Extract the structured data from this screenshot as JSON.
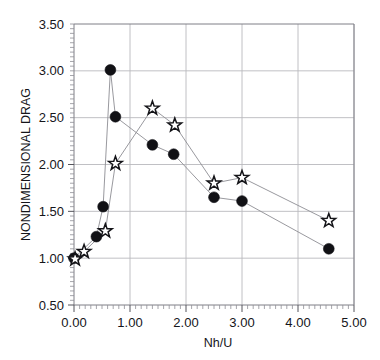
{
  "chart_data": {
    "type": "line",
    "title": "",
    "xlabel": "Nh/U",
    "ylabel": "NONDIMENSIONAL DRAG",
    "xlim": [
      0.0,
      5.0
    ],
    "ylim": [
      0.5,
      3.5
    ],
    "xticks": [
      0.0,
      1.0,
      2.0,
      3.0,
      4.0,
      5.0
    ],
    "xtick_labels": [
      "0.00",
      "1.00",
      "2.00",
      "3.00",
      "4.00",
      "5.00"
    ],
    "yticks": [
      0.5,
      1.0,
      1.5,
      2.0,
      2.5,
      3.0,
      3.5
    ],
    "ytick_labels": [
      "0.50",
      "1.00",
      "1.50",
      "2.00",
      "2.50",
      "3.00",
      "3.50"
    ],
    "grid": true,
    "legend": "none",
    "x_minor_tick_step": 0.1,
    "y_minor_tick_step": 0.05,
    "series": [
      {
        "name": "circle-series",
        "marker": "circle",
        "color": "#111115",
        "points": [
          {
            "x": 0.0,
            "y": 1.0
          },
          {
            "x": 0.4,
            "y": 1.23
          },
          {
            "x": 0.52,
            "y": 1.55
          },
          {
            "x": 0.65,
            "y": 3.01
          },
          {
            "x": 0.74,
            "y": 2.51
          },
          {
            "x": 1.4,
            "y": 2.21
          },
          {
            "x": 1.78,
            "y": 2.11
          },
          {
            "x": 2.5,
            "y": 1.65
          },
          {
            "x": 3.0,
            "y": 1.61
          },
          {
            "x": 4.55,
            "y": 1.1
          }
        ]
      },
      {
        "name": "star-series",
        "marker": "star",
        "color": "#141418",
        "points": [
          {
            "x": 0.02,
            "y": 0.99
          },
          {
            "x": 0.18,
            "y": 1.07
          },
          {
            "x": 0.56,
            "y": 1.29
          },
          {
            "x": 0.74,
            "y": 2.01
          },
          {
            "x": 1.4,
            "y": 2.6
          },
          {
            "x": 1.8,
            "y": 2.42
          },
          {
            "x": 2.5,
            "y": 1.8
          },
          {
            "x": 3.0,
            "y": 1.86
          },
          {
            "x": 4.55,
            "y": 1.4
          }
        ]
      }
    ]
  },
  "colors": {
    "background": "#ffffff",
    "grid": "#b9b9bd",
    "frame": "#7e7e86",
    "marker": "#111115",
    "series_line": "#8d8d93"
  }
}
